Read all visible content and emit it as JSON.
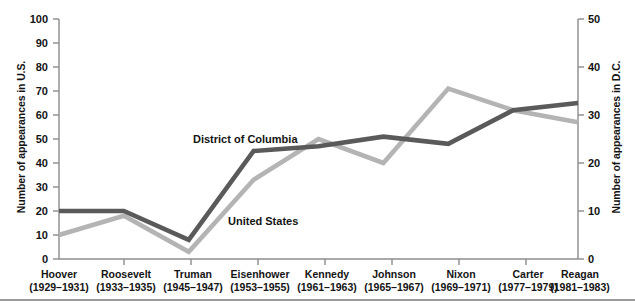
{
  "chart_data": {
    "type": "line",
    "title": "",
    "categories": [
      "Hoover",
      "Roosevelt",
      "Truman",
      "Eisenhower",
      "Kennedy",
      "Johnson",
      "Nixon",
      "Carter",
      "Reagan"
    ],
    "category_years": [
      "(1929–1931)",
      "(1933–1935)",
      "(1945–1947)",
      "(1953–1955)",
      "(1961–1963)",
      "(1965–1967)",
      "(1969–1971)",
      "(1977–1979)",
      "(1981–1983)"
    ],
    "series": [
      {
        "name": "United States",
        "axis": "left",
        "color": "#5a5a5a",
        "values": [
          20,
          20,
          8,
          45,
          47,
          51,
          48,
          62,
          65
        ]
      },
      {
        "name": "District of Columbia",
        "axis": "right",
        "color": "#b4b4b4",
        "values_left_scale": [
          10,
          18,
          3,
          33,
          50,
          40,
          71,
          62,
          57
        ],
        "values": [
          5,
          9,
          1.5,
          16.5,
          25,
          20,
          35.5,
          31,
          28.5
        ]
      }
    ],
    "xlabel": "",
    "ylabel": "Number of appearances in U.S.",
    "ylabel_right": "Number of appearances in D.C.",
    "ylim": [
      0,
      100
    ],
    "yticks": [
      "0",
      "10",
      "20",
      "30",
      "40",
      "50",
      "60",
      "70",
      "80",
      "90",
      "100"
    ],
    "ylim_right": [
      0,
      50
    ],
    "yticks_right": [
      "0",
      "10",
      "20",
      "30",
      "40",
      "50"
    ],
    "grid": false,
    "legend_position": "inline-annotations",
    "annotations": [
      {
        "text": "District of Columbia",
        "series": "District of Columbia"
      },
      {
        "text": "United States",
        "series": "United States"
      }
    ]
  },
  "axes": {
    "left_title": "Number of appearances in U.S.",
    "right_title": "Number of appearances in D.C."
  },
  "colors": {
    "series_us": "#5a5a5a",
    "series_dc": "#b4b4b4",
    "axis": "#8c8c8c",
    "text": "#141414",
    "rule": "#9a9a9a"
  }
}
